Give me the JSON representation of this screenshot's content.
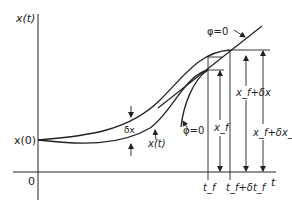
{
  "diagram": {
    "axes": {
      "y_label": "x(t)",
      "x_label": "t",
      "origin_label": "0",
      "start_label": "x(0)"
    },
    "curves": {
      "nominal_label": "x(t)",
      "variation_label": "δx"
    },
    "constraint": {
      "upper_label": "φ=0",
      "lower_label": "φ=0"
    },
    "endpoints": {
      "xf_label": "x_f",
      "xf_plus_dx_label": "x_f+δx",
      "xf_plus_dxf_label": "x_f+δx_f",
      "tf_label": "t_f",
      "tf_plus_dtf_label": "t_f+δt_f"
    },
    "colors": {
      "stroke": "#222222",
      "background": "#ffffff"
    }
  }
}
